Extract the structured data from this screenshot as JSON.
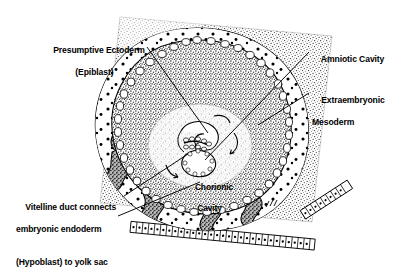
{
  "figure": {
    "background_color": "#ffffff",
    "ink_color": "#000000",
    "width": 396,
    "height": 259
  },
  "labels": {
    "presumptive_ectoderm": {
      "line1": "Presumptive Ectoderm",
      "line2": "(Epiblast)"
    },
    "amniotic_cavity": {
      "line1": "Amniotic Cavity"
    },
    "extraembryonic_mesoderm": {
      "line1": "Extraembryonic",
      "line2": "Mesoderm"
    },
    "vitelline_duct": {
      "line1": "Vitelline duct connects",
      "line2": "embryonic endoderm",
      "line3": "(Hypoblast) to yolk sac"
    },
    "chorionic_cavity": {
      "line1": "Chorionic",
      "line2": "Cavity"
    }
  },
  "structures": {
    "decidua": "stippled-maternal-tissue",
    "trophoblast_lacunae": "dark-irregular-blobs",
    "chorion_cell_ring": "chain-of-rounded-cells",
    "uterine_epithelium": "columnar-cell-row-bottom",
    "embryonic_disc": "bilaminar-disc-center",
    "amnion": "amniotic-cavity-center",
    "yolk_sac": "white-sac-below-disc"
  }
}
